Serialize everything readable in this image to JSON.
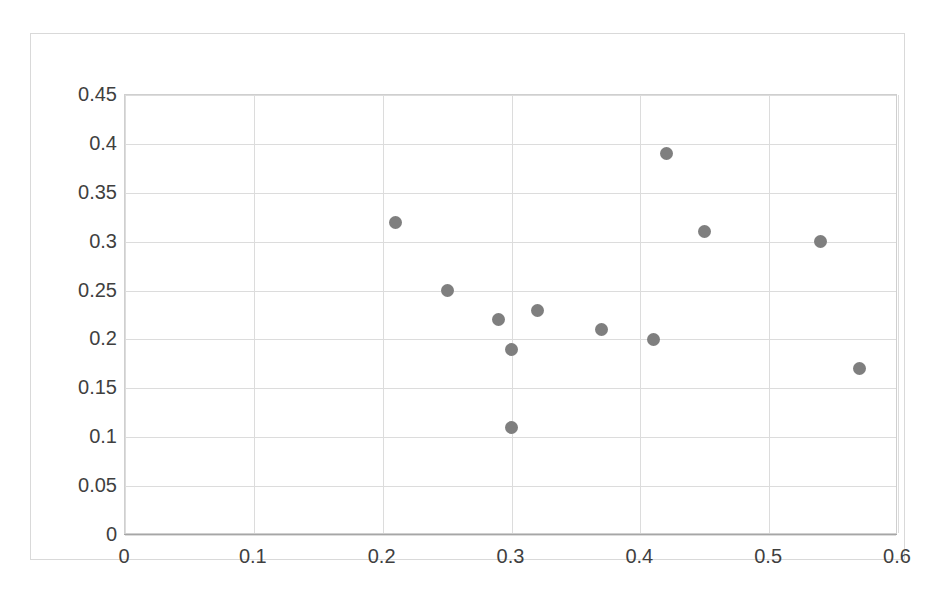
{
  "chart_data": {
    "type": "scatter",
    "title": "",
    "xlabel": "",
    "ylabel": "",
    "xlim": [
      0,
      0.6
    ],
    "ylim": [
      0,
      0.45
    ],
    "grid": true,
    "legend": "none",
    "marker_color": "#7f7f7f",
    "marker_shape": "circle",
    "xticks": [
      "0",
      "0.1",
      "0.2",
      "0.3",
      "0.4",
      "0.5",
      "0.6"
    ],
    "xtick_values": [
      0,
      0.1,
      0.2,
      0.3,
      0.4,
      0.5,
      0.6
    ],
    "yticks": [
      "0",
      "0.05",
      "0.1",
      "0.15",
      "0.2",
      "0.25",
      "0.3",
      "0.35",
      "0.4",
      "0.45"
    ],
    "ytick_values": [
      0,
      0.05,
      0.1,
      0.15,
      0.2,
      0.25,
      0.3,
      0.35,
      0.4,
      0.45
    ],
    "series": [
      {
        "name": "Series 1",
        "color": "#7f7f7f",
        "points": [
          {
            "x": 0.21,
            "y": 0.32
          },
          {
            "x": 0.25,
            "y": 0.25
          },
          {
            "x": 0.29,
            "y": 0.22
          },
          {
            "x": 0.3,
            "y": 0.19
          },
          {
            "x": 0.3,
            "y": 0.11
          },
          {
            "x": 0.32,
            "y": 0.23
          },
          {
            "x": 0.37,
            "y": 0.21
          },
          {
            "x": 0.41,
            "y": 0.2
          },
          {
            "x": 0.42,
            "y": 0.39
          },
          {
            "x": 0.45,
            "y": 0.31
          },
          {
            "x": 0.54,
            "y": 0.3
          },
          {
            "x": 0.57,
            "y": 0.17
          }
        ]
      }
    ]
  }
}
